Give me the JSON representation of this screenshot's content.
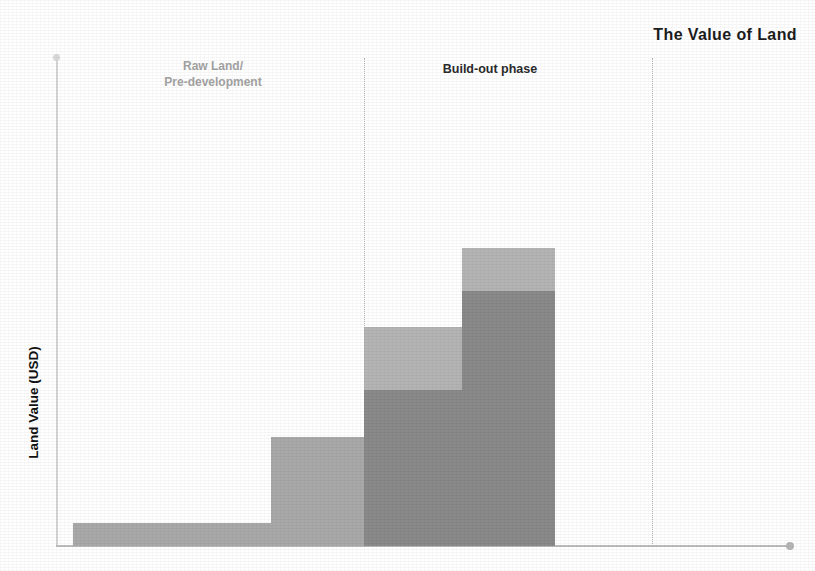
{
  "chart_data": {
    "type": "bar",
    "title": "The Value of Land",
    "xlabel": "",
    "ylabel": "Land Value (USD)",
    "stacked": true,
    "grid": false,
    "legend": "none",
    "axis_tick_labels": [],
    "ylim": [
      0,
      490
    ],
    "categories": [
      "Stage 1",
      "Stage 2",
      "Stage 3",
      "Stage 4"
    ],
    "series": [
      {
        "name": "Base value",
        "color": "#8a8a8a",
        "values": [
          23,
          109,
          156,
          255
        ]
      },
      {
        "name": "Added value",
        "color": "#b4b4b4",
        "values": [
          0,
          0,
          63,
          43
        ]
      }
    ],
    "totals": [
      23,
      109,
      219,
      298
    ],
    "annotations": [
      {
        "label": "Raw Land/\nPre-development",
        "phase": 1
      },
      {
        "label": "Build-out phase",
        "phase": 2
      }
    ],
    "bars": [
      {
        "name": "bar-1",
        "left": 73,
        "width": 198,
        "dark_height": 23,
        "light_height": 0,
        "solo": true
      },
      {
        "name": "bar-2",
        "left": 271,
        "width": 93,
        "dark_height": 109,
        "light_height": 0,
        "solo": true
      },
      {
        "name": "bar-3",
        "left": 364,
        "width": 98,
        "dark_height": 156,
        "light_height": 63,
        "solo": false
      },
      {
        "name": "bar-4",
        "left": 462,
        "width": 93,
        "dark_height": 255,
        "light_height": 43,
        "solo": false
      }
    ]
  },
  "chart": {
    "title": "The Value of Land",
    "y_axis_title": "Land Value (USD)",
    "phase_one_label": "Raw Land/\nPre-development",
    "phase_two_label": "Build-out phase",
    "colors": {
      "dark_segment": "#8a8a8a",
      "light_segment": "#b4b4b4",
      "solo_bar": "#a9a9a9",
      "title_text": "#1c1c1c",
      "phase_one_text": "#a3a3a3",
      "phase_two_text": "#2b2b2b",
      "axis": "#c6c6c6",
      "divider": "#b9b9b9",
      "background": "#ffffff"
    }
  }
}
